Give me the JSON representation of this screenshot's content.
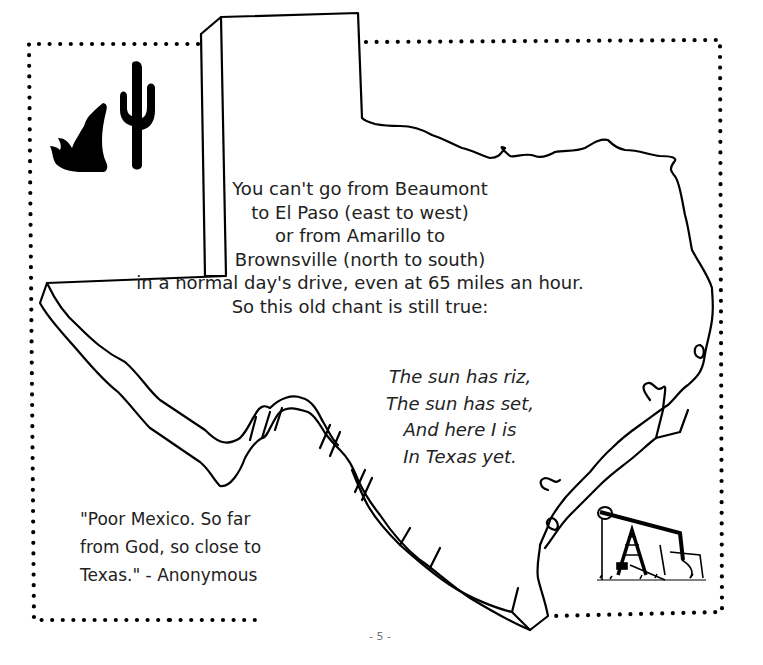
{
  "page": {
    "page_number": "- 5 -"
  },
  "main_text": {
    "lines": [
      "You can't go from Beaumont",
      "to El Paso (east to west)",
      "or from Amarillo to",
      "Brownsville (north to south)",
      "in a normal day's drive, even at 65 miles an hour.",
      "So this old chant is still true:"
    ]
  },
  "chant": {
    "lines": [
      "The sun has riz,",
      "The sun has set,",
      "And here I is",
      "In Texas yet."
    ]
  },
  "quote": {
    "lines": [
      "\"Poor Mexico. So far",
      "from God, so close to",
      "Texas.\" - Anonymous"
    ]
  },
  "illustrations": {
    "icons": [
      "howling-coyote-icon",
      "saguaro-cactus-icon",
      "oil-pumpjack-icon"
    ],
    "map": "texas-outline-map"
  },
  "colors": {
    "ink": "#000000",
    "text": "#222222",
    "page_number": "#777777",
    "background": "#ffffff"
  }
}
